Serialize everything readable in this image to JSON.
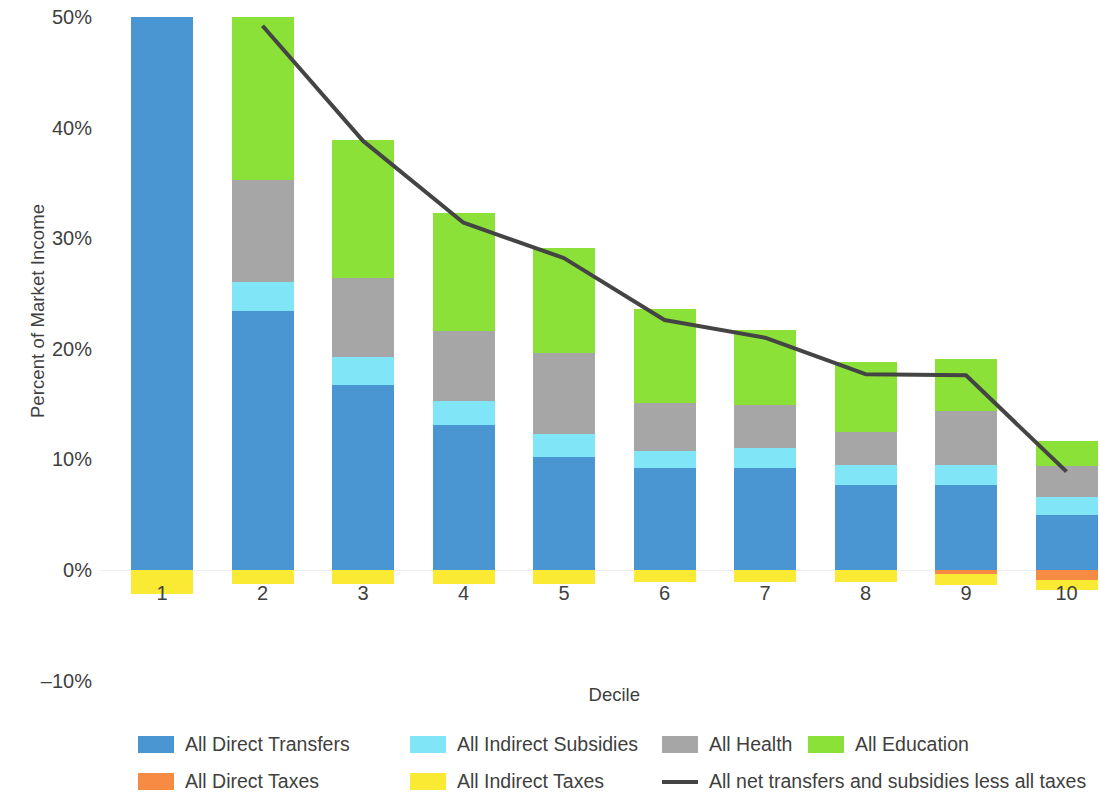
{
  "chart_data": {
    "type": "bar",
    "subtype": "stacked-bar-with-line",
    "title": "",
    "xlabel": "Decile",
    "ylabel": "Percent of Market Income",
    "categories": [
      "1",
      "2",
      "3",
      "4",
      "5",
      "6",
      "7",
      "8",
      "9",
      "10"
    ],
    "ylim": [
      -10,
      50
    ],
    "yticks": [
      -10,
      0,
      10,
      20,
      30,
      40,
      50
    ],
    "ytick_labels": [
      "–10%",
      "0%",
      "10%",
      "20%",
      "30%",
      "40%",
      "50%"
    ],
    "grid": false,
    "legend_position": "bottom",
    "series": [
      {
        "name": "All Direct Transfers",
        "color": "#4a96d2",
        "values": [
          50.0,
          23.4,
          16.7,
          13.1,
          10.2,
          9.2,
          9.2,
          7.7,
          7.7,
          5.0
        ]
      },
      {
        "name": "All Indirect Subsidies",
        "color": "#7fe5f7",
        "values": [
          0.0,
          2.6,
          2.6,
          2.2,
          2.1,
          1.6,
          1.8,
          1.8,
          1.8,
          1.6
        ]
      },
      {
        "name": "All Health",
        "color": "#a6a6a6",
        "values": [
          0.0,
          9.3,
          7.1,
          6.3,
          7.3,
          4.3,
          3.9,
          3.0,
          4.9,
          2.8
        ]
      },
      {
        "name": "All Education",
        "color": "#8ce139",
        "values": [
          0.0,
          14.7,
          12.5,
          10.7,
          9.5,
          8.5,
          6.8,
          6.3,
          4.7,
          2.3
        ]
      },
      {
        "name": "All Direct Taxes",
        "color": "#f68c43",
        "values": [
          0.0,
          0.0,
          0.0,
          0.0,
          0.0,
          0.0,
          0.0,
          0.0,
          -0.4,
          -0.9
        ]
      },
      {
        "name": "All Indirect Taxes",
        "color": "#faea34",
        "values": [
          -2.2,
          -1.3,
          -1.3,
          -1.3,
          -1.3,
          -1.1,
          -1.1,
          -1.1,
          -1.0,
          -0.9
        ]
      }
    ],
    "line_series": {
      "name": "All net transfers and subsidies less all taxes",
      "color": "#444444",
      "x": [
        "2",
        "3",
        "4",
        "5",
        "6",
        "7",
        "8",
        "9",
        "10"
      ],
      "values": [
        49.2,
        38.8,
        31.4,
        28.2,
        22.6,
        21.0,
        17.7,
        17.6,
        8.9
      ]
    }
  },
  "axes": {
    "y_title": "Percent of Market Income",
    "x_title": "Decile",
    "y_ticks": [
      {
        "label": "50%",
        "value": 50
      },
      {
        "label": "40%",
        "value": 40
      },
      {
        "label": "30%",
        "value": 30
      },
      {
        "label": "20%",
        "value": 20
      },
      {
        "label": "10%",
        "value": 10
      },
      {
        "label": "0%",
        "value": 0
      },
      {
        "label": "–10%",
        "value": -10
      }
    ],
    "x_ticks": [
      "1",
      "2",
      "3",
      "4",
      "5",
      "6",
      "7",
      "8",
      "9",
      "10"
    ]
  },
  "legend": {
    "items": [
      {
        "label": "All Direct Transfers",
        "color": "#4a96d2",
        "kind": "swatch"
      },
      {
        "label": "All Indirect Subsidies",
        "color": "#7fe5f7",
        "kind": "swatch"
      },
      {
        "label": "All Health",
        "color": "#a6a6a6",
        "kind": "swatch"
      },
      {
        "label": "All Education",
        "color": "#8ce139",
        "kind": "swatch"
      },
      {
        "label": "All Direct Taxes",
        "color": "#f68c43",
        "kind": "swatch"
      },
      {
        "label": "All Indirect Taxes",
        "color": "#faea34",
        "kind": "swatch"
      },
      {
        "label": "All net transfers and subsidies less all taxes",
        "color": "#444444",
        "kind": "line"
      }
    ]
  }
}
